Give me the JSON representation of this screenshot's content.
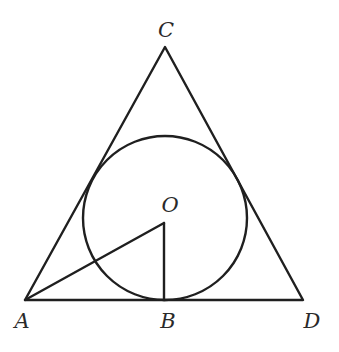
{
  "diagram": {
    "type": "geometry",
    "points": {
      "A": {
        "label": "A",
        "x": 25,
        "y": 300
      },
      "B": {
        "label": "B",
        "x": 164,
        "y": 300
      },
      "C": {
        "label": "C",
        "x": 165,
        "y": 47
      },
      "D": {
        "label": "D",
        "x": 303,
        "y": 300
      },
      "O": {
        "label": "O",
        "x": 164,
        "y": 223
      }
    },
    "circle": {
      "center": "O",
      "cx": 165,
      "cy": 218,
      "r": 82
    },
    "segments": [
      [
        "A",
        "C"
      ],
      [
        "C",
        "D"
      ],
      [
        "A",
        "D"
      ],
      [
        "O",
        "A"
      ],
      [
        "O",
        "B"
      ]
    ],
    "labels": {
      "C": "C",
      "O": "O",
      "A": "A",
      "B": "B",
      "D": "D"
    },
    "colors": {
      "line": "#1f1f1f",
      "text": "#2a2a2a",
      "background": "#ffffff"
    }
  }
}
